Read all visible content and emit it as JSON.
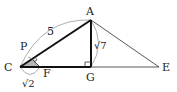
{
  "diagram": {
    "title": "",
    "points": {
      "A": {
        "label": "A",
        "x": 91,
        "y": 20
      },
      "C": {
        "label": "C",
        "x": 20,
        "y": 67
      },
      "G": {
        "label": "G",
        "x": 91,
        "y": 67
      },
      "E": {
        "label": "E",
        "x": 159,
        "y": 67
      },
      "F": {
        "label": "F",
        "x": 40,
        "y": 67
      },
      "P": {
        "label": "P",
        "x": 32,
        "y": 59
      }
    },
    "measures": {
      "CA": "5",
      "AG": "√7",
      "CF": "√2"
    },
    "segments": [
      {
        "from": "C",
        "to": "A",
        "style": "bold"
      },
      {
        "from": "A",
        "to": "G",
        "style": "bold"
      },
      {
        "from": "C",
        "to": "G",
        "style": "bold"
      },
      {
        "from": "G",
        "to": "E",
        "style": "thin"
      },
      {
        "from": "A",
        "to": "E",
        "style": "thin"
      },
      {
        "from": "P",
        "to": "F",
        "style": "thin"
      }
    ],
    "marks": {
      "right_angle_G": "right-angle at G",
      "right_angle_P": "right-angle at P",
      "shaded_triangle": "triangle CPF shaded gray"
    },
    "colors": {
      "line": "#222222",
      "arc": "#999999",
      "shade": "#b5b5b5"
    }
  }
}
